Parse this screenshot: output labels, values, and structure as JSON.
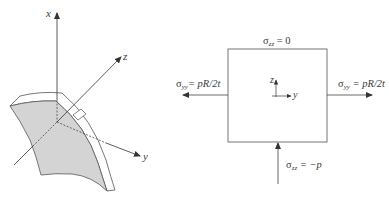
{
  "left_figure": {
    "description": "Curved shell element with coordinate axes",
    "axes": {
      "x": "x",
      "y": "y",
      "z": "z"
    }
  },
  "right_figure": {
    "description": "Stress element (square) with applied stresses",
    "top": {
      "symbol": "σ",
      "sub": "zz",
      "rhs": "= 0"
    },
    "left": {
      "symbol": "σ",
      "sub": "yy",
      "rhs": "= pR/2t"
    },
    "right": {
      "symbol": "σ",
      "sub": "yy",
      "rhs": "= pR/2t"
    },
    "bottom": {
      "symbol": "σ",
      "sub": "zz",
      "rhs": "= −p"
    },
    "inner_axes": {
      "z": "z",
      "y": "y"
    }
  },
  "colors": {
    "line": "#4a4a4a",
    "shell_fill": "#d4d4d4",
    "background": "#ffffff"
  }
}
